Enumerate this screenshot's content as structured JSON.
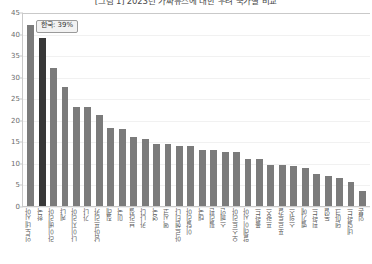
{
  "chart_data": {
    "type": "bar",
    "title": "[그림 1] 2023년 가짜뉴스에 대한 우려 국가별 비교",
    "xlabel": "",
    "ylabel": "",
    "ylim": [
      0,
      45
    ],
    "ytick_step": 5,
    "yticks": [
      "45",
      "40",
      "35",
      "30",
      "25",
      "20",
      "15",
      "10",
      "5",
      "0"
    ],
    "grid": true,
    "legend": false,
    "categories": [
      "인도네시아",
      "한국",
      "라이베리아",
      "케냐",
      "나이지리아",
      "가나",
      "남아프리카",
      "칠레",
      "미국",
      "브라질",
      "카나다",
      "영국",
      "멕시코",
      "아르헨티나",
      "이탈리아",
      "태국",
      "필리핀",
      "스페인",
      "오스트리아",
      "말레이시아",
      "폴란드",
      "프랑스",
      "포르투갈",
      "스위스",
      "벨기에",
      "핀란드",
      "독일",
      "덴마크",
      "네덜란드",
      "일본"
    ],
    "values": [
      42,
      39,
      32,
      27.5,
      23,
      23,
      21,
      18,
      17.8,
      16,
      15.5,
      14.5,
      14.3,
      14,
      14,
      13,
      13,
      12.5,
      12.5,
      11,
      10.8,
      9.5,
      9.5,
      9.2,
      8.8,
      7.5,
      7,
      6.5,
      5.5,
      3.5
    ],
    "highlight_index": 1,
    "colors": {
      "bar": "#7b7b7b",
      "bar_highlight": "#383838",
      "grid": "#f1f1f1",
      "axis": "#c9c9c9",
      "tick_text": "#6b6b6b",
      "label_text": "#5a5a5a"
    },
    "annotation": {
      "text": "한국: 39%",
      "target_index": 1
    }
  }
}
